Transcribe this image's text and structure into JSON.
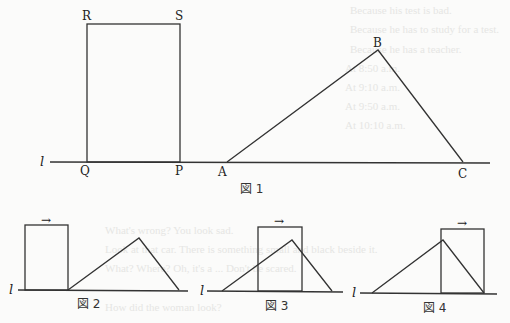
{
  "background_showthrough": [
    "Because his test is bad.",
    "Because he has to study for a test.",
    "Because he has a teacher.",
    "At 8:50 a.m.",
    "At 9:10 a.m.",
    "At 9:50 a.m.",
    "At 10:10 a.m.",
    "What's wrong? You look sad.",
    "Look at that car. There is something small and black beside it.",
    "What? Where? Oh, it's a ... Don't be scared.",
    "How did the woman look?"
  ],
  "figure1": {
    "caption": "図 1",
    "line_label": "l",
    "points": {
      "R": "R",
      "S": "S",
      "Q": "Q",
      "P": "P",
      "A": "A",
      "B": "B",
      "C": "C"
    }
  },
  "figure2": {
    "caption": "図 2",
    "line_label": "l",
    "arrow": "→"
  },
  "figure3": {
    "caption": "図 3",
    "line_label": "l",
    "arrow": "→"
  },
  "figure4": {
    "caption": "図 4",
    "line_label": "l",
    "arrow": "→"
  }
}
